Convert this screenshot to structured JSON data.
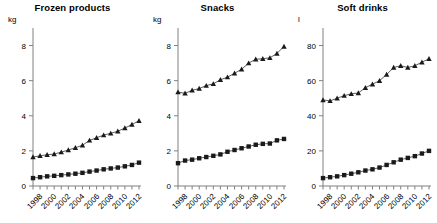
{
  "figure": {
    "background_color": "#ffffff",
    "marker_color": "#1a1a1a",
    "line_color": "#4d4d4d",
    "axis_color": "#808080"
  },
  "chart_data": [
    {
      "type": "line",
      "title": "Frozen products",
      "xlabel": "",
      "ylabel": "kg",
      "ylim": [
        0,
        9
      ],
      "yticks": [
        0,
        2,
        4,
        6,
        8
      ],
      "ytick_labels": [
        "0",
        "2",
        "4",
        "6",
        "8"
      ],
      "xlim": [
        1998,
        2013
      ],
      "xticks": [
        1998,
        1999,
        2000,
        2001,
        2002,
        2003,
        2004,
        2005,
        2006,
        2007,
        2008,
        2009,
        2010,
        2011,
        2012,
        2013
      ],
      "xtick_labels": [
        "1998",
        "",
        "2000",
        "",
        "2002",
        "",
        "2004",
        "",
        "2006",
        "",
        "2008",
        "",
        "2010",
        "",
        "2012",
        ""
      ],
      "grid": false,
      "legend": "none",
      "x": [
        1998,
        1999,
        2000,
        2001,
        2002,
        2003,
        2004,
        2005,
        2006,
        2007,
        2008,
        2009,
        2010,
        2011,
        2012,
        2013
      ],
      "series": [
        {
          "name": "upper",
          "marker": "triangle",
          "values": [
            1.65,
            1.72,
            1.78,
            1.82,
            1.93,
            2.05,
            2.18,
            2.32,
            2.6,
            2.75,
            2.9,
            3.0,
            3.12,
            3.3,
            3.5,
            3.72
          ]
        },
        {
          "name": "lower",
          "marker": "square",
          "values": [
            0.45,
            0.5,
            0.55,
            0.58,
            0.62,
            0.66,
            0.7,
            0.75,
            0.82,
            0.88,
            0.95,
            1.0,
            1.05,
            1.12,
            1.2,
            1.33
          ]
        }
      ]
    },
    {
      "type": "line",
      "title": "Snacks",
      "xlabel": "",
      "ylabel": "kg",
      "ylim": [
        0,
        9
      ],
      "yticks": [
        0,
        2,
        4,
        6,
        8
      ],
      "ytick_labels": [
        "0",
        "2",
        "4",
        "6",
        "8"
      ],
      "xlim": [
        1998,
        2013
      ],
      "xticks": [
        1998,
        1999,
        2000,
        2001,
        2002,
        2003,
        2004,
        2005,
        2006,
        2007,
        2008,
        2009,
        2010,
        2011,
        2012,
        2013
      ],
      "xtick_labels": [
        "1998",
        "",
        "2000",
        "",
        "2002",
        "",
        "2004",
        "",
        "2006",
        "",
        "2008",
        "",
        "2010",
        "",
        "2012",
        ""
      ],
      "grid": false,
      "legend": "none",
      "x": [
        1998,
        1999,
        2000,
        2001,
        2002,
        2003,
        2004,
        2005,
        2006,
        2007,
        2008,
        2009,
        2010,
        2011,
        2012,
        2013
      ],
      "series": [
        {
          "name": "upper",
          "marker": "triangle",
          "values": [
            5.35,
            5.28,
            5.45,
            5.55,
            5.72,
            5.82,
            6.05,
            6.2,
            6.42,
            6.65,
            7.0,
            7.22,
            7.25,
            7.3,
            7.55,
            7.95
          ]
        },
        {
          "name": "lower",
          "marker": "square",
          "values": [
            1.3,
            1.45,
            1.5,
            1.58,
            1.65,
            1.72,
            1.8,
            1.95,
            2.05,
            2.15,
            2.25,
            2.35,
            2.4,
            2.42,
            2.6,
            2.68
          ]
        }
      ]
    },
    {
      "type": "line",
      "title": "Soft drinks",
      "xlabel": "",
      "ylabel": "l",
      "ylim": [
        0,
        90
      ],
      "yticks": [
        0,
        20,
        40,
        60,
        80
      ],
      "ytick_labels": [
        "0",
        "20",
        "40",
        "60",
        "80"
      ],
      "xlim": [
        1998,
        2013
      ],
      "xticks": [
        1998,
        1999,
        2000,
        2001,
        2002,
        2003,
        2004,
        2005,
        2006,
        2007,
        2008,
        2009,
        2010,
        2011,
        2012,
        2013
      ],
      "xtick_labels": [
        "1998",
        "",
        "2000",
        "",
        "2002",
        "",
        "2004",
        "",
        "2006",
        "",
        "2008",
        "",
        "2010",
        "",
        "2012",
        ""
      ],
      "grid": false,
      "legend": "none",
      "x": [
        1998,
        1999,
        2000,
        2001,
        2002,
        2003,
        2004,
        2005,
        2006,
        2007,
        2008,
        2009,
        2010,
        2011,
        2012,
        2013
      ],
      "series": [
        {
          "name": "upper",
          "marker": "triangle",
          "values": [
            49.0,
            48.5,
            50.0,
            51.5,
            52.5,
            53.0,
            56.0,
            58.0,
            60.0,
            63.5,
            67.5,
            68.5,
            67.5,
            68.5,
            70.5,
            72.5
          ]
        },
        {
          "name": "lower",
          "marker": "square",
          "values": [
            4.5,
            5.0,
            5.5,
            6.2,
            7.0,
            7.8,
            8.8,
            9.5,
            10.5,
            12.0,
            13.5,
            15.0,
            16.0,
            17.0,
            18.5,
            20.0
          ]
        }
      ]
    }
  ]
}
